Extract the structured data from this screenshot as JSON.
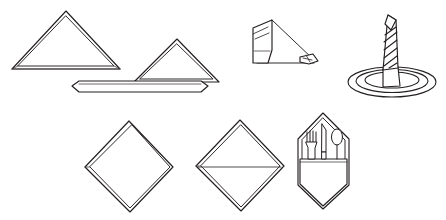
{
  "figure": {
    "background_color": "#ffffff",
    "line_color": "#231f20",
    "width": 446,
    "height": 220,
    "rows": 2,
    "columns": 3
  },
  "items": [
    {
      "id": "fold-triangle",
      "name": "Simple triangle fold",
      "row": 1,
      "column": 1,
      "description": "Napkin folded once into a plain standing triangle with a doubled hem edge."
    },
    {
      "id": "fold-triangle-on-band",
      "name": "Triangle on folded band",
      "row": 1,
      "column": 2,
      "description": "Triangle resting on a long flat folded band with pointed ends."
    },
    {
      "id": "fold-roll-and-point",
      "name": "Rolled napkin with pointed tail",
      "row": 1,
      "column": 3,
      "description": "Napkin rolled into an upright tube with a long diagonal tail ending in a small folded point."
    },
    {
      "id": "fold-candle-on-plate",
      "name": "Candle fold on plate",
      "row": 1,
      "column": 4,
      "description": "Spiral-rolled candle fold standing upright in the centre of a round plate."
    },
    {
      "id": "fold-diamond",
      "name": "Plain diamond fold",
      "row": 2,
      "column": 1,
      "description": "Square napkin set on point as a plain diamond with a doubled edge."
    },
    {
      "id": "fold-diamond-creased",
      "name": "Diamond fold with centre crease",
      "row": 2,
      "column": 2,
      "description": "Diamond fold showing a horizontal centre crease across the middle."
    },
    {
      "id": "fold-cutlery-pocket",
      "name": "Cutlery pocket fold",
      "row": 2,
      "column": 3,
      "description": "Pointed pocket fold holding a fork, a knife and a spoon."
    }
  ],
  "utensils": [
    {
      "id": "fork",
      "name": "Fork",
      "tines": 4
    },
    {
      "id": "knife",
      "name": "Knife"
    },
    {
      "id": "spoon",
      "name": "Spoon"
    }
  ]
}
